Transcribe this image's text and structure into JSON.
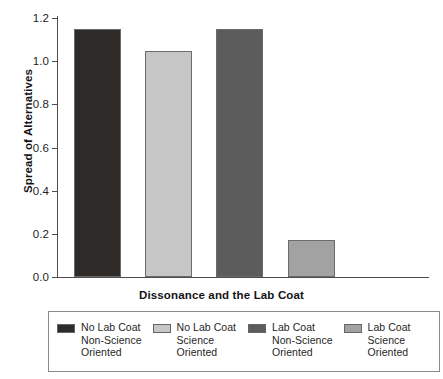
{
  "chart_data": {
    "type": "bar",
    "title": "",
    "xlabel": "Dissonance and the Lab Coat",
    "ylabel": "Spread of Alternatives",
    "categories": [
      "No Lab Coat Non-Science Oriented",
      "No Lab Coat Science Oriented",
      "Lab Coat Non-Science Oriented",
      "Lab Coat Science Oriented"
    ],
    "values": [
      1.15,
      1.045,
      1.15,
      0.17
    ],
    "ylim": [
      0.0,
      1.2
    ],
    "ytick_labels": [
      "1.2",
      "1.0",
      "0.8",
      "0.6",
      "0.4",
      "0.2",
      "0.0"
    ],
    "ytick_values": [
      1.2,
      1.0,
      0.8,
      0.6,
      0.4,
      0.2,
      0.0
    ],
    "grid": false,
    "legend_position": "bottom",
    "bar_colors": [
      "#2e2b29",
      "#c6c6c6",
      "#5c5c5c",
      "#a2a2a2"
    ],
    "series": [
      {
        "name": "Spread of Alternatives",
        "values": [
          1.15,
          1.045,
          1.15,
          0.17
        ]
      }
    ]
  },
  "axes": {
    "y_title": "Spread of Alternatives",
    "x_title": "Dissonance and the Lab Coat",
    "y_ticks": [
      {
        "label": "1.2",
        "value": 1.2
      },
      {
        "label": "1.0",
        "value": 1.0
      },
      {
        "label": "0.8",
        "value": 0.8
      },
      {
        "label": "0.6",
        "value": 0.6
      },
      {
        "label": "0.4",
        "value": 0.4
      },
      {
        "label": "0.2",
        "value": 0.2
      },
      {
        "label": "0.0",
        "value": 0.0
      }
    ]
  },
  "legend": {
    "items": [
      {
        "label": "No Lab Coat\nNon-Science\nOriented",
        "color": "#2e2b29"
      },
      {
        "label": "No Lab Coat\nScience\nOriented",
        "color": "#c6c6c6"
      },
      {
        "label": "Lab Coat\nNon-Science\nOriented",
        "color": "#5c5c5c"
      },
      {
        "label": "Lab Coat\nScience\nOriented",
        "color": "#a2a2a2"
      }
    ]
  }
}
